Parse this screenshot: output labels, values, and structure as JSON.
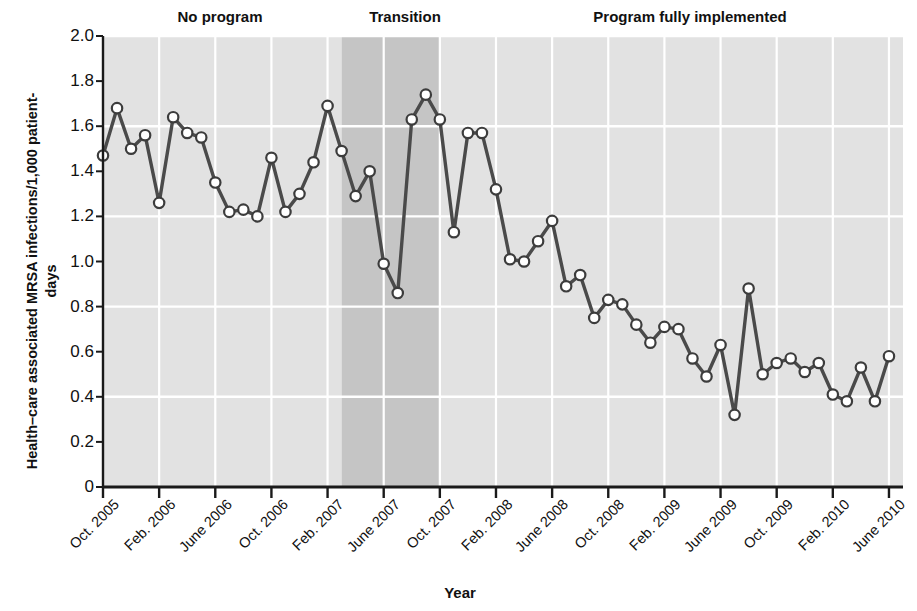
{
  "chart_data": {
    "type": "line",
    "title": "",
    "xlabel": "Year",
    "ylabel": "Health–care associated MRSA infections/1,000 patient-days",
    "ylim": [
      0,
      2.0
    ],
    "ytick_labels": [
      "0",
      "0.2",
      "0.4",
      "0.6",
      "0.8",
      "1.0",
      "1.2",
      "1.4",
      "1.6",
      "1.8",
      "2.0"
    ],
    "ytick_values": [
      0,
      0.2,
      0.4,
      0.6,
      0.8,
      1.0,
      1.2,
      1.4,
      1.6,
      1.8,
      2.0
    ],
    "gridlines_y": [
      0.4,
      0.8,
      1.2,
      1.6,
      2.0
    ],
    "grid": true,
    "legend_position": "none",
    "xtick_labels": [
      "Oct. 2005",
      "Feb. 2006",
      "June 2006",
      "Oct. 2006",
      "Feb. 2007",
      "June 2007",
      "Oct. 2007",
      "Feb. 2008",
      "June 2008",
      "Oct. 2008",
      "Feb. 2009",
      "June 2009",
      "Oct. 2009",
      "Feb. 2010",
      "June 2010"
    ],
    "xtick_months": [
      0,
      4,
      8,
      12,
      16,
      20,
      24,
      28,
      32,
      36,
      40,
      44,
      48,
      52,
      56
    ],
    "x_start_month_index": 0,
    "x_end_month_index": 57,
    "annotations": [
      {
        "text": "No program",
        "start_month": 0,
        "end_month": 17
      },
      {
        "text": "Transition",
        "start_month": 17,
        "end_month": 24
      },
      {
        "text": "Program fully implemented",
        "start_month": 24,
        "end_month": 57
      }
    ],
    "series": [
      {
        "name": "Health-care associated MRSA infections per 1,000 patient-days",
        "x": [
          "Oct. 2005",
          "Nov. 2005",
          "Dec. 2005",
          "Jan. 2006",
          "Feb. 2006",
          "Mar. 2006",
          "Apr. 2006",
          "May 2006",
          "June 2006",
          "July 2006",
          "Aug. 2006",
          "Sept. 2006",
          "Oct. 2006",
          "Nov. 2006",
          "Dec. 2006",
          "Jan. 2007",
          "Feb. 2007",
          "Mar. 2007",
          "Apr. 2007",
          "May 2007",
          "June 2007",
          "July 2007",
          "Aug. 2007",
          "Sept. 2007",
          "Oct. 2007",
          "Nov. 2007",
          "Dec. 2007",
          "Jan. 2008",
          "Feb. 2008",
          "Mar. 2008",
          "Apr. 2008",
          "May 2008",
          "June 2008",
          "July 2008",
          "Aug. 2008",
          "Sept. 2008",
          "Oct. 2008",
          "Nov. 2008",
          "Dec. 2008",
          "Jan. 2009",
          "Feb. 2009",
          "Mar. 2009",
          "Apr. 2009",
          "May 2009",
          "June 2009",
          "July 2009",
          "Aug. 2009",
          "Sept. 2009",
          "Oct. 2009",
          "Nov. 2009",
          "Dec. 2009",
          "Jan. 2010",
          "Feb. 2010",
          "Mar. 2010",
          "Apr. 2010",
          "May 2010",
          "June 2010"
        ],
        "values": [
          1.47,
          1.68,
          1.5,
          1.56,
          1.26,
          1.64,
          1.57,
          1.55,
          1.35,
          1.22,
          1.23,
          1.2,
          1.46,
          1.22,
          1.3,
          1.44,
          1.69,
          1.49,
          1.29,
          1.4,
          0.99,
          0.86,
          1.63,
          1.74,
          1.63,
          1.13,
          1.57,
          1.57,
          1.32,
          1.01,
          1.0,
          1.09,
          1.18,
          0.89,
          0.94,
          0.75,
          0.83,
          0.81,
          0.72,
          0.64,
          0.71,
          0.7,
          0.57,
          0.49,
          0.63,
          0.32,
          0.88,
          0.5,
          0.55,
          0.57,
          0.51,
          0.55,
          0.41,
          0.38,
          0.53,
          0.38,
          0.58
        ]
      }
    ],
    "colors": {
      "line": "#4a4a4a",
      "marker_fill": "#ffffff",
      "marker_stroke": "#3c3c3c",
      "plot_bg_light": "#e2e2e2",
      "plot_bg_shaded": "#c5c5c5",
      "gridline": "#ffffff",
      "axis": "#1a1a1a",
      "text": "#111111"
    }
  }
}
